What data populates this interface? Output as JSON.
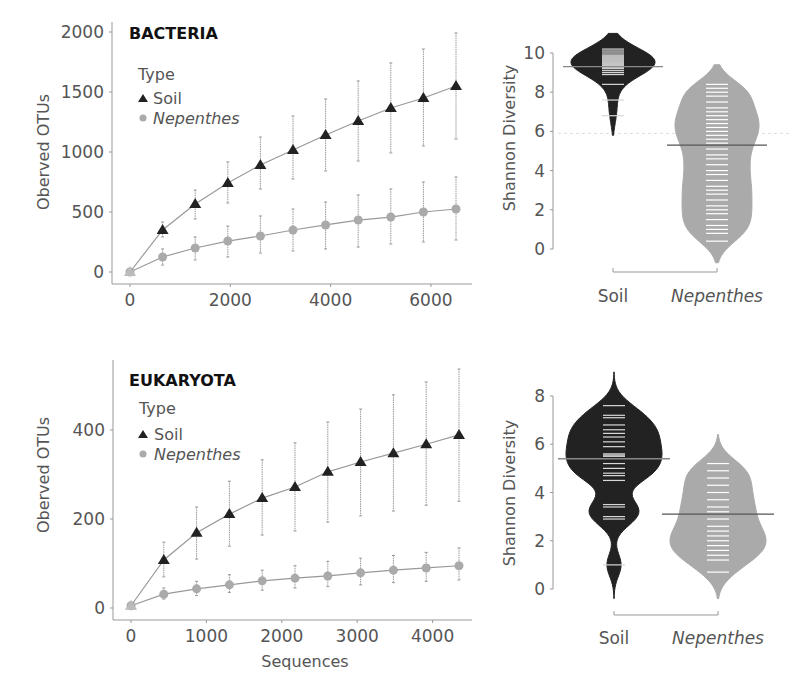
{
  "chart_data": [
    {
      "id": "bacteria-rarefaction",
      "type": "line",
      "title": "BACTERIA",
      "xlabel": "",
      "ylabel": "Oberved OTUs",
      "xlim": [
        0,
        6800
      ],
      "ylim": [
        0,
        2050
      ],
      "xticks": [
        0,
        2000,
        4000,
        6000
      ],
      "yticks": [
        0,
        500,
        1000,
        1500,
        2000
      ],
      "legend": {
        "title": "Type",
        "position": "top-left"
      },
      "x": [
        0,
        650,
        1300,
        1950,
        2600,
        3250,
        3900,
        4550,
        5200,
        5850,
        6500
      ],
      "series": [
        {
          "name": "Soil",
          "marker": "triangle",
          "color": "#222222",
          "values": [
            0,
            350,
            567,
            742,
            892,
            1017,
            1142,
            1258,
            1367,
            1450,
            1550
          ],
          "err_low": [
            0,
            292,
            442,
            575,
            692,
            775,
            842,
            925,
            992,
            1050,
            1108
          ],
          "err_high": [
            0,
            417,
            683,
            917,
            1125,
            1300,
            1442,
            1592,
            1742,
            1858,
            1992
          ]
        },
        {
          "name": "Nepenthes",
          "marker": "circle",
          "color": "#aaaaaa",
          "italic": true,
          "values": [
            0,
            125,
            200,
            258,
            300,
            350,
            392,
            433,
            458,
            500,
            525
          ],
          "err_low": [
            0,
            58,
            100,
            125,
            158,
            175,
            192,
            208,
            233,
            250,
            267
          ],
          "err_high": [
            0,
            192,
            292,
            383,
            467,
            525,
            583,
            642,
            692,
            750,
            792
          ]
        }
      ]
    },
    {
      "id": "bacteria-shannon",
      "type": "violin",
      "title": "",
      "xlabel": "",
      "ylabel": "Shannon Diversity",
      "ylim": [
        -0.8,
        10.8
      ],
      "yticks": [
        0,
        2,
        4,
        6,
        8,
        10
      ],
      "categories": [
        "Soil",
        "Nepenthes"
      ],
      "overall_mean": 5.9,
      "groups": [
        {
          "name": "Soil",
          "color": "#222222",
          "mean": 9.3,
          "min": 5.8,
          "max": 11.0,
          "points": [
            10.2,
            10.1,
            10.0,
            9.9,
            9.85,
            9.8,
            9.75,
            9.7,
            9.65,
            9.6,
            9.55,
            9.5,
            9.45,
            9.4,
            9.35,
            9.3,
            9.25,
            9.2,
            9.1,
            9.0,
            8.9,
            8.4,
            7.6,
            6.8
          ]
        },
        {
          "name": "Nepenthes",
          "color": "#aaaaaa",
          "italic": true,
          "mean": 5.3,
          "min": -0.7,
          "max": 9.4,
          "points": [
            8.4,
            8.2,
            8.0,
            7.8,
            7.5,
            7.2,
            7.0,
            6.8,
            6.6,
            6.4,
            6.2,
            6.0,
            5.8,
            5.6,
            5.4,
            5.1,
            4.8,
            4.6,
            4.3,
            4.0,
            3.8,
            3.5,
            3.2,
            3.0,
            2.8,
            2.5,
            2.2,
            2.0,
            1.8,
            1.5,
            1.2,
            1.0,
            0.8,
            0.4
          ]
        }
      ]
    },
    {
      "id": "eukaryota-rarefaction",
      "type": "line",
      "title": "EUKARYOTA",
      "xlabel": "Sequences",
      "ylabel": "Oberved OTUs",
      "xlim": [
        0,
        4550
      ],
      "ylim": [
        0,
        545
      ],
      "xticks": [
        0,
        1000,
        2000,
        3000,
        4000
      ],
      "yticks": [
        0,
        200,
        400
      ],
      "legend": {
        "title": "Type",
        "position": "top-left"
      },
      "x": [
        0,
        435,
        870,
        1305,
        1740,
        2175,
        2610,
        3045,
        3480,
        3915,
        4350
      ],
      "series": [
        {
          "name": "Soil",
          "marker": "triangle",
          "color": "#222222",
          "values": [
            5,
            108,
            169,
            211,
            247,
            272,
            306,
            328,
            348,
            368,
            389
          ],
          "err_low": [
            5,
            70,
            110,
            139,
            164,
            173,
            193,
            207,
            218,
            231,
            240
          ],
          "err_high": [
            5,
            148,
            227,
            285,
            333,
            371,
            418,
            447,
            479,
            508,
            537
          ]
        },
        {
          "name": "Nepenthes",
          "marker": "circle",
          "color": "#aaaaaa",
          "italic": true,
          "values": [
            5,
            31,
            43,
            52,
            61,
            67,
            72,
            79,
            85,
            90,
            95
          ],
          "err_low": [
            5,
            20,
            28,
            35,
            40,
            45,
            48,
            52,
            57,
            60,
            63
          ],
          "err_high": [
            5,
            45,
            60,
            75,
            85,
            95,
            105,
            112,
            118,
            125,
            135
          ]
        }
      ]
    },
    {
      "id": "eukaryota-shannon",
      "type": "violin",
      "title": "",
      "xlabel": "",
      "ylabel": "Shannon Diversity",
      "ylim": [
        -0.5,
        8.8
      ],
      "yticks": [
        0,
        2,
        4,
        6,
        8
      ],
      "categories": [
        "Soil",
        "Nepenthes"
      ],
      "overall_mean": null,
      "groups": [
        {
          "name": "Soil",
          "color": "#222222",
          "mean": 5.4,
          "min": -0.4,
          "max": 9.0,
          "points": [
            7.6,
            7.2,
            7.1,
            6.8,
            6.6,
            6.45,
            6.3,
            6.1,
            5.9,
            5.6,
            5.55,
            5.5,
            5.2,
            5.0,
            4.8,
            4.7,
            4.5,
            3.5,
            3.4,
            3.0,
            2.9,
            1.0
          ]
        },
        {
          "name": "Nepenthes",
          "color": "#aaaaaa",
          "italic": true,
          "mean": 3.1,
          "min": -0.4,
          "max": 6.4,
          "points": [
            5.2,
            4.9,
            4.6,
            4.3,
            4.0,
            3.7,
            3.4,
            3.2,
            2.9,
            2.6,
            2.4,
            2.2,
            2.0,
            1.8,
            1.6,
            1.4,
            1.2,
            0.7
          ]
        }
      ]
    }
  ]
}
